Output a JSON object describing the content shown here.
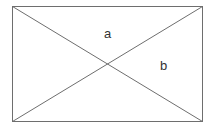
{
  "diagram": {
    "type": "rectangle-with-diagonals",
    "stroke_color": "#6e6e6e",
    "rect": {
      "x": 12.5,
      "y": 6.5,
      "width": 190,
      "height": 115
    },
    "labels": [
      {
        "id": "a",
        "text": "a",
        "x": 104,
        "y": 38
      },
      {
        "id": "b",
        "text": "b",
        "x": 160,
        "y": 70
      }
    ]
  }
}
